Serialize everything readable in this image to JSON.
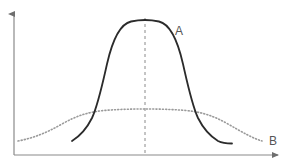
{
  "figure": {
    "width": 288,
    "height": 166,
    "background": "#ffffff"
  },
  "axes": {
    "color": "#8a8a8a",
    "x_axis_name": "horizontal-axis",
    "y_axis_name": "vertical-axis",
    "x_axis_y": 155,
    "y_axis_x": 14,
    "x_axis_end": 281,
    "y_axis_top": 11,
    "has_arrowheads": true,
    "tick_labels_x": [],
    "tick_labels_y": [],
    "xlabel": "",
    "ylabel": ""
  },
  "center_line": {
    "name": "mean-reference-line",
    "x": 145,
    "style": "dashed",
    "color": "#8a8a8a",
    "dash": "3,3"
  },
  "series": {
    "a": {
      "label": "A",
      "label_x": 175,
      "label_y": 35,
      "color": "#2b2b2b",
      "style": "solid",
      "width": 1.8,
      "description": "tall narrow peaked curve"
    },
    "b": {
      "label": "B",
      "label_x": 269,
      "label_y": 145,
      "color": "#9a9a9a",
      "style": "dotted",
      "width": 1.6,
      "dash": "1,2.2",
      "description": "low wide flat curve"
    }
  },
  "chart_data": {
    "type": "line",
    "title": "",
    "subtitle": "",
    "xlabel": "",
    "ylabel": "",
    "grid": false,
    "legend": "inline-end-labels",
    "xlim": [
      0,
      100
    ],
    "ylim": [
      0,
      100
    ],
    "axis_ticks": false,
    "annotations": [
      {
        "text": "A",
        "x": 62,
        "y": 88,
        "note": "label on tall narrow curve"
      },
      {
        "text": "B",
        "x": 97,
        "y": 10,
        "note": "label at right tail of wide curve"
      },
      {
        "text": "",
        "x": 50,
        "y": 0,
        "note": "dashed vertical line marks common mean at x=50"
      }
    ],
    "series": [
      {
        "name": "A",
        "style": "solid",
        "color": "#2b2b2b",
        "mean": 50,
        "sigma": 11,
        "peak_value": 93,
        "x": [
          22,
          26,
          30,
          34,
          37,
          40,
          43,
          46,
          50,
          54,
          57,
          60,
          63,
          66,
          70,
          74,
          78,
          82
        ],
        "y": [
          11,
          18,
          28,
          45,
          62,
          78,
          88,
          92,
          93,
          92,
          88,
          78,
          62,
          45,
          28,
          18,
          12,
          9
        ]
      },
      {
        "name": "B",
        "style": "dotted",
        "color": "#9a9a9a",
        "mean": 50,
        "sigma": 30,
        "peak_value": 33,
        "x": [
          2,
          8,
          14,
          20,
          26,
          32,
          38,
          44,
          50,
          56,
          62,
          68,
          74,
          80,
          86,
          92,
          97
        ],
        "y": [
          10,
          13,
          16,
          20,
          24,
          28,
          31,
          32,
          33,
          32,
          31,
          28,
          24,
          20,
          16,
          13,
          10
        ]
      }
    ],
    "crossings": [
      {
        "x": 32,
        "y": 28,
        "note": "left intersection of curve A and curve B"
      },
      {
        "x": 68,
        "y": 28,
        "note": "right intersection of curve A and curve B"
      }
    ]
  }
}
